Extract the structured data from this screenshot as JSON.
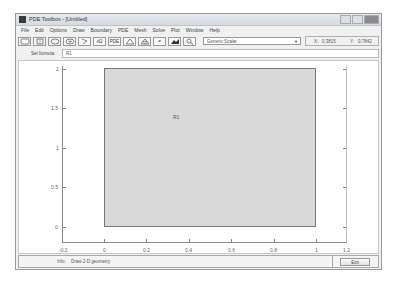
{
  "window": {
    "title": "PDE Toolbox - [Untitled]"
  },
  "menu": {
    "items": [
      "File",
      "Edit",
      "Options",
      "Draw",
      "Boundary",
      "PDE",
      "Mesh",
      "Solve",
      "Plot",
      "Window",
      "Help"
    ]
  },
  "toolbar": {
    "buttons": [
      {
        "name": "rectangle-icon",
        "label": ""
      },
      {
        "name": "rectangle-centered-icon",
        "label": ""
      },
      {
        "name": "ellipse-icon",
        "label": ""
      },
      {
        "name": "ellipse-centered-icon",
        "label": ""
      },
      {
        "name": "polygon-icon",
        "label": ""
      },
      {
        "name": "boundary-mode-button",
        "label": "∂Ω"
      },
      {
        "name": "pde-spec-button",
        "label": "PDE"
      },
      {
        "name": "init-mesh-icon",
        "label": ""
      },
      {
        "name": "refine-mesh-icon",
        "label": ""
      },
      {
        "name": "solve-icon",
        "label": "="
      },
      {
        "name": "plot-icon",
        "label": ""
      },
      {
        "name": "zoom-icon",
        "label": ""
      }
    ],
    "application_mode": "Generic Scalar",
    "x_label": "X:",
    "x_value": "0.3815",
    "y_label": "Y:",
    "y_value": "0.7842"
  },
  "formula": {
    "label": "Set formula:",
    "value": "R1"
  },
  "plot": {
    "shape_label": "R1",
    "x_ticks": [
      "-0.2",
      "0",
      "0.2",
      "0.4",
      "0.6",
      "0.8",
      "1",
      "1.2"
    ],
    "y_ticks": [
      "0",
      "0.5",
      "1",
      "1.5",
      "2"
    ],
    "xlim": [
      -0.2,
      1.2
    ],
    "ylim": [
      -0.1,
      2.05
    ],
    "rectangle": {
      "x0": 0,
      "x1": 1,
      "y0": 0,
      "y1": 2
    },
    "fill_color": "#d9d9d9"
  },
  "status": {
    "label": "Info:",
    "text": "Draw 2-D geometry.",
    "exit_label": "Exit"
  }
}
